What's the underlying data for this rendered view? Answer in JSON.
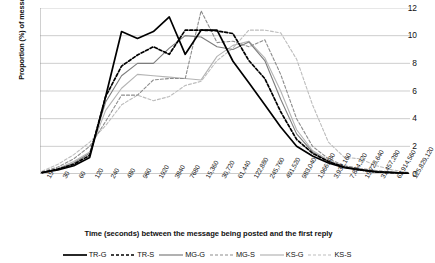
{
  "axes": {
    "ylabel": "Proportion (%) of messages",
    "xlabel": "Time (seconds) between the message being posted and the first reply",
    "yticks": [
      "12",
      "10",
      "8",
      "6",
      "4",
      "2",
      "0"
    ]
  },
  "legend": [
    {
      "label": "TR-G",
      "color": "#000000",
      "dash": "none",
      "width": 1.7
    },
    {
      "label": "TR-S",
      "color": "#000000",
      "dash": "3,2",
      "width": 1.7
    },
    {
      "label": "MG-G",
      "color": "#7d7d7d",
      "dash": "none",
      "width": 1.1
    },
    {
      "label": "MG-S",
      "color": "#8c8c8c",
      "dash": "3,2",
      "width": 1.1
    },
    {
      "label": "KS-G",
      "color": "#b4b4b4",
      "dash": "none",
      "width": 1.1
    },
    {
      "label": "KS-S",
      "color": "#bdbdbd",
      "dash": "3,2",
      "width": 1.1
    }
  ],
  "chart_data": {
    "type": "line",
    "title": "",
    "xlabel": "Time (seconds) between the message being posted and the first reply",
    "ylabel": "Proportion (%) of messages",
    "ylim": [
      0,
      12
    ],
    "ytick_step": 2,
    "grid": true,
    "legend_position": "bottom",
    "categories": [
      "15",
      "30",
      "60",
      "120",
      "240",
      "480",
      "960",
      "1920",
      "3840",
      "7680",
      "15,360",
      "30,720",
      "61,440",
      "122,880",
      "245,760",
      "491,520",
      "983,040",
      "1,966,080",
      "3,932,160",
      "7,864,320",
      "15,728,640",
      "31,457,280",
      "62,914,560",
      "125,829,120"
    ],
    "series": [
      {
        "name": "TR-G",
        "values": [
          0.1,
          0.3,
          0.6,
          1.2,
          5.6,
          10.3,
          9.8,
          10.3,
          11.35,
          8.65,
          10.4,
          10.4,
          8.15,
          6.6,
          5.0,
          3.4,
          2.0,
          1.3,
          0.8,
          0.45,
          0.3,
          0.15,
          0.1,
          0.05
        ]
      },
      {
        "name": "TR-S",
        "values": [
          0.1,
          0.35,
          0.7,
          1.35,
          5.6,
          7.8,
          8.6,
          9.2,
          8.65,
          10.4,
          10.4,
          10.35,
          10.15,
          8.2,
          6.9,
          4.5,
          2.5,
          1.5,
          0.9,
          0.5,
          0.3,
          0.15,
          0.1,
          0.05
        ]
      },
      {
        "name": "MG-G",
        "values": [
          0.1,
          0.35,
          0.8,
          1.5,
          5.2,
          7.1,
          8.0,
          8.0,
          9.1,
          10.0,
          9.9,
          9.2,
          9.0,
          9.55,
          8.2,
          5.4,
          2.9,
          1.6,
          0.9,
          0.5,
          0.3,
          0.2,
          0.1,
          0.05
        ]
      },
      {
        "name": "MG-S",
        "values": [
          0.15,
          0.5,
          1.1,
          2.0,
          3.8,
          5.7,
          5.7,
          6.8,
          6.9,
          6.9,
          11.8,
          9.5,
          9.6,
          9.2,
          9.7,
          7.2,
          4.0,
          2.0,
          1.1,
          0.6,
          0.4,
          0.25,
          0.15,
          0.1
        ]
      },
      {
        "name": "KS-G",
        "values": [
          0.1,
          0.4,
          0.9,
          1.6,
          4.6,
          6.2,
          7.2,
          7.1,
          7.0,
          6.9,
          6.8,
          8.5,
          9.3,
          9.6,
          8.4,
          6.0,
          3.2,
          1.7,
          1.0,
          0.55,
          0.35,
          0.2,
          0.12,
          0.06
        ]
      },
      {
        "name": "KS-S",
        "values": [
          0.2,
          0.7,
          1.4,
          2.3,
          3.5,
          5.0,
          5.7,
          5.3,
          5.6,
          6.4,
          6.7,
          8.2,
          9.1,
          10.4,
          10.4,
          10.2,
          8.3,
          5.0,
          2.3,
          1.2,
          1.1,
          0.6,
          0.3,
          0.12
        ]
      }
    ]
  }
}
